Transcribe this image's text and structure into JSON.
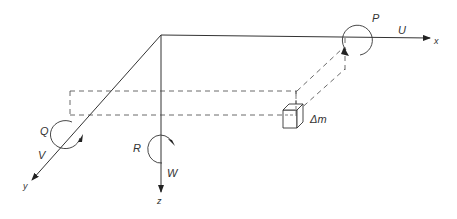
{
  "diagram": {
    "axes": {
      "x": {
        "label": "x",
        "velocity": "U",
        "rotation": "P"
      },
      "y": {
        "label": "y",
        "velocity": "V",
        "rotation": "Q"
      },
      "z": {
        "label": "z",
        "velocity": "W",
        "rotation": "R"
      }
    },
    "element": {
      "label": "Δm"
    },
    "colors": {
      "line": "#333333",
      "background": "#ffffff"
    }
  }
}
